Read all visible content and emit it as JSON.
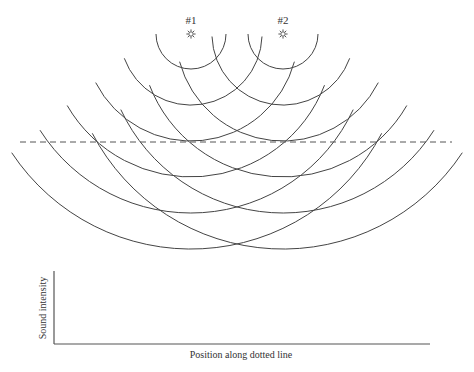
{
  "diagram": {
    "sources": [
      {
        "label": "#1",
        "icon": "speaker-star-icon",
        "cx": 191,
        "cy": 34
      },
      {
        "label": "#2",
        "icon": "speaker-star-icon",
        "cx": 283,
        "cy": 34
      }
    ],
    "wavefronts": {
      "radii": [
        35,
        71,
        107,
        143,
        179,
        215
      ],
      "outer_end_angles_deg": [
        0,
        20,
        27,
        30,
        32.5,
        33.5
      ],
      "inner_end_angles_deg": [
        0,
        2,
        15,
        21,
        25,
        27.5
      ],
      "stroke_color": "#444444"
    },
    "dotted_line": {
      "x1": 20,
      "x2": 452,
      "y": 142,
      "color": "#555555"
    }
  },
  "graph": {
    "ylabel": "Sound intensity",
    "xlabel": "Position along dotted line",
    "axis_color": "#555555"
  },
  "chart_data": {
    "type": "line",
    "title": "",
    "xlabel": "Position along dotted line",
    "ylabel": "Sound intensity",
    "series": [],
    "grid": false,
    "note": "Empty axes to be filled in"
  }
}
